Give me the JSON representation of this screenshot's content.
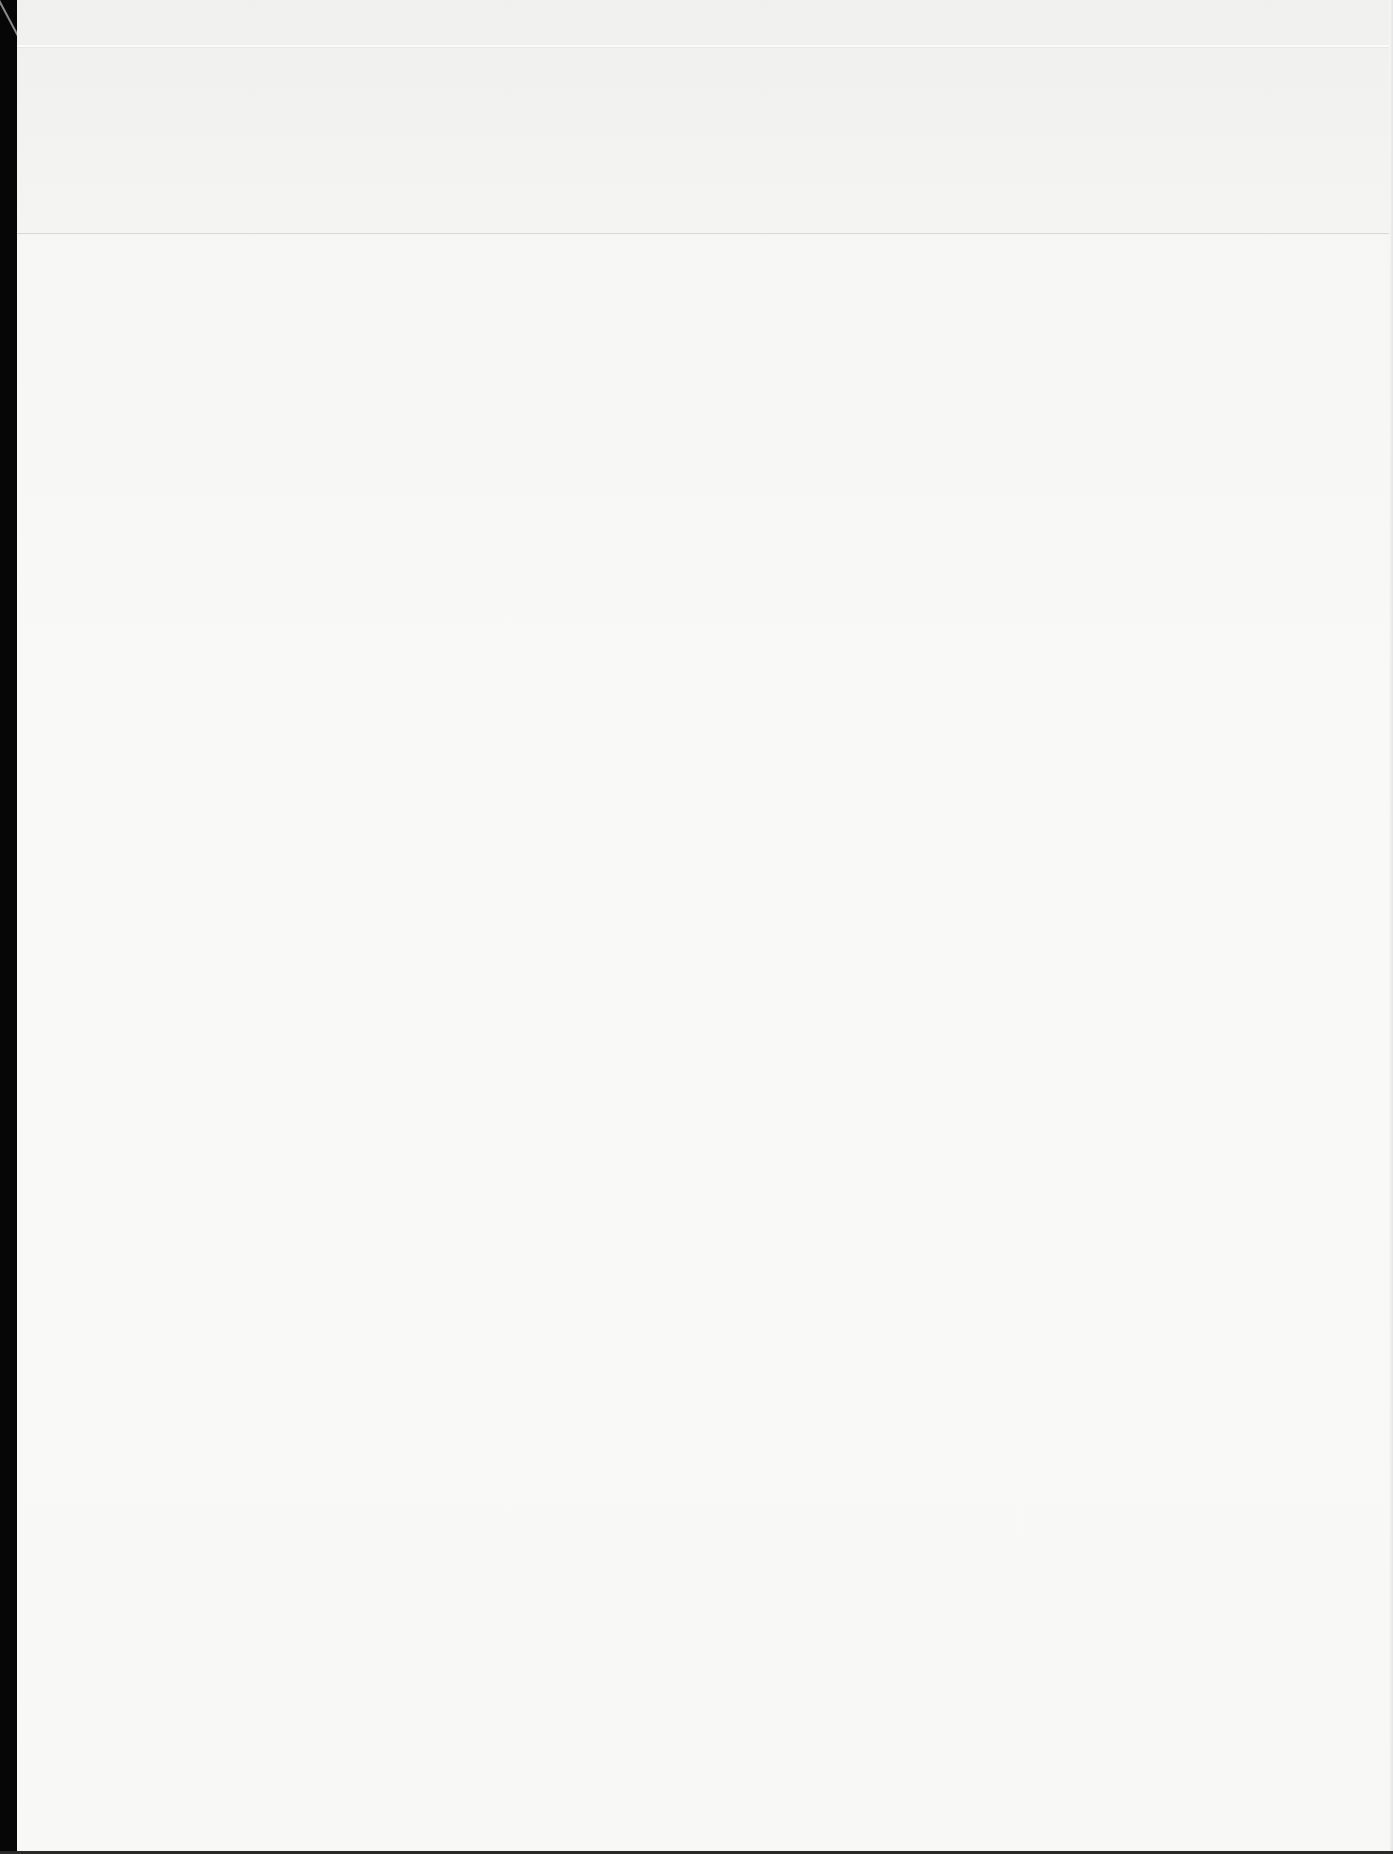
{
  "document": {
    "content": "",
    "colors": {
      "paper": "#f8f8f7",
      "scan_border": "#060606",
      "crease": "#d9d9d8"
    }
  }
}
